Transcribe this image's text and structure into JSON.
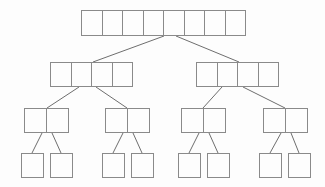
{
  "diagram": {
    "type": "tree",
    "background_color": "#fdfdfd",
    "node_border_color": "#8a8a8a",
    "node_fill_color": "#fdfdfd",
    "edge_color": "#6e6e6e",
    "levels": 4,
    "nodes": [
      {
        "id": "root",
        "level": 0,
        "cells": [
          "",
          "",
          "",
          "",
          "",
          "",
          "",
          ""
        ],
        "cell_count": 8,
        "x": 81,
        "y": 10,
        "cell_width": 21.5,
        "height": 26
      },
      {
        "id": "n1-0",
        "level": 1,
        "cells": [
          "",
          "",
          "",
          ""
        ],
        "cell_count": 4,
        "x": 50,
        "y": 62,
        "cell_width": 21.5,
        "height": 25
      },
      {
        "id": "n1-1",
        "level": 1,
        "cells": [
          "",
          "",
          "",
          ""
        ],
        "cell_count": 4,
        "x": 196,
        "y": 62,
        "cell_width": 21.5,
        "height": 25
      },
      {
        "id": "n2-0",
        "level": 2,
        "cells": [
          "",
          ""
        ],
        "cell_count": 2,
        "x": 24,
        "y": 108,
        "cell_width": 23,
        "height": 25
      },
      {
        "id": "n2-1",
        "level": 2,
        "cells": [
          "",
          ""
        ],
        "cell_count": 2,
        "x": 105,
        "y": 108,
        "cell_width": 23,
        "height": 25
      },
      {
        "id": "n2-2",
        "level": 2,
        "cells": [
          "",
          ""
        ],
        "cell_count": 2,
        "x": 181,
        "y": 108,
        "cell_width": 23,
        "height": 25
      },
      {
        "id": "n2-3",
        "level": 2,
        "cells": [
          "",
          ""
        ],
        "cell_count": 2,
        "x": 263,
        "y": 108,
        "cell_width": 23,
        "height": 25
      },
      {
        "id": "n3-0",
        "level": 3,
        "cells": [
          ""
        ],
        "cell_count": 1,
        "x": 21,
        "y": 153,
        "cell_width": 23,
        "height": 25
      },
      {
        "id": "n3-1",
        "level": 3,
        "cells": [
          ""
        ],
        "cell_count": 1,
        "x": 50,
        "y": 153,
        "cell_width": 23,
        "height": 25
      },
      {
        "id": "n3-2",
        "level": 3,
        "cells": [
          ""
        ],
        "cell_count": 1,
        "x": 102,
        "y": 153,
        "cell_width": 23,
        "height": 25
      },
      {
        "id": "n3-3",
        "level": 3,
        "cells": [
          ""
        ],
        "cell_count": 1,
        "x": 131,
        "y": 153,
        "cell_width": 23,
        "height": 25
      },
      {
        "id": "n3-4",
        "level": 3,
        "cells": [
          ""
        ],
        "cell_count": 1,
        "x": 178,
        "y": 153,
        "cell_width": 23,
        "height": 25
      },
      {
        "id": "n3-5",
        "level": 3,
        "cells": [
          ""
        ],
        "cell_count": 1,
        "x": 207,
        "y": 153,
        "cell_width": 23,
        "height": 25
      },
      {
        "id": "n3-6",
        "level": 3,
        "cells": [
          ""
        ],
        "cell_count": 1,
        "x": 259,
        "y": 153,
        "cell_width": 23,
        "height": 25
      },
      {
        "id": "n3-7",
        "level": 3,
        "cells": [
          ""
        ],
        "cell_count": 1,
        "x": 288,
        "y": 153,
        "cell_width": 23,
        "height": 25
      }
    ],
    "edges": [
      {
        "id": "e-root-n1-0",
        "from": "root",
        "to": "n1-0",
        "x1": 164,
        "y1": 36,
        "x2": 93,
        "y2": 62
      },
      {
        "id": "e-root-n1-1",
        "from": "root",
        "to": "n1-1",
        "x1": 176,
        "y1": 36,
        "x2": 239,
        "y2": 62
      },
      {
        "id": "e-n1-0-n2-0",
        "from": "n1-0",
        "to": "n2-0",
        "x1": 79,
        "y1": 87,
        "x2": 47,
        "y2": 108
      },
      {
        "id": "e-n1-0-n2-1",
        "from": "n1-0",
        "to": "n2-1",
        "x1": 96,
        "y1": 87,
        "x2": 127,
        "y2": 108
      },
      {
        "id": "e-n1-1-n2-2",
        "from": "n1-1",
        "to": "n2-2",
        "x1": 222,
        "y1": 87,
        "x2": 203,
        "y2": 108
      },
      {
        "id": "e-n1-1-n2-3",
        "from": "n1-1",
        "to": "n2-3",
        "x1": 243,
        "y1": 87,
        "x2": 285,
        "y2": 108
      },
      {
        "id": "e-n2-0-n3-0",
        "from": "n2-0",
        "to": "n3-0",
        "x1": 42,
        "y1": 133,
        "x2": 32,
        "y2": 153
      },
      {
        "id": "e-n2-0-n3-1",
        "from": "n2-0",
        "to": "n3-1",
        "x1": 52,
        "y1": 133,
        "x2": 61,
        "y2": 153
      },
      {
        "id": "e-n2-1-n3-2",
        "from": "n2-1",
        "to": "n3-2",
        "x1": 123,
        "y1": 133,
        "x2": 113,
        "y2": 153
      },
      {
        "id": "e-n2-1-n3-3",
        "from": "n2-1",
        "to": "n3-3",
        "x1": 133,
        "y1": 133,
        "x2": 142,
        "y2": 153
      },
      {
        "id": "e-n2-2-n3-4",
        "from": "n2-2",
        "to": "n3-4",
        "x1": 199,
        "y1": 133,
        "x2": 189,
        "y2": 153
      },
      {
        "id": "e-n2-2-n3-5",
        "from": "n2-2",
        "to": "n3-5",
        "x1": 209,
        "y1": 133,
        "x2": 218,
        "y2": 153
      },
      {
        "id": "e-n2-3-n3-6",
        "from": "n2-3",
        "to": "n3-6",
        "x1": 281,
        "y1": 133,
        "x2": 270,
        "y2": 153
      },
      {
        "id": "e-n2-3-n3-7",
        "from": "n2-3",
        "to": "n3-7",
        "x1": 291,
        "y1": 133,
        "x2": 299,
        "y2": 153
      }
    ]
  }
}
